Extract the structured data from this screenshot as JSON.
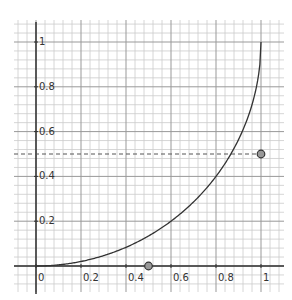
{
  "chart_data": {
    "type": "line",
    "title": "",
    "xlabel": "",
    "ylabel": "",
    "xlim": [
      -0.1,
      1.1
    ],
    "ylim": [
      -0.11,
      1.1
    ],
    "grid": true,
    "grid_major_step": 0.2,
    "grid_minor_step": 0.04,
    "x_ticks": [
      "0",
      "0.2",
      "0.4",
      "0.6",
      "0.8",
      "1"
    ],
    "y_ticks": [
      "0.2",
      "0.4",
      "0.6",
      "0.8",
      "1"
    ],
    "x_tick_values": [
      0,
      0.2,
      0.4,
      0.6,
      0.8,
      1
    ],
    "y_tick_values": [
      0.2,
      0.4,
      0.6,
      0.8,
      1
    ],
    "series": [
      {
        "name": "curve",
        "function": "y = 1 - sqrt(1 - x^2)",
        "x": [
          0,
          0.1,
          0.2,
          0.3,
          0.4,
          0.5,
          0.6,
          0.7,
          0.8,
          0.9,
          0.95,
          1
        ],
        "y": [
          0,
          0.005,
          0.02,
          0.046,
          0.083,
          0.134,
          0.2,
          0.286,
          0.4,
          0.564,
          0.688,
          1
        ],
        "color": "#333333"
      }
    ],
    "points": [
      {
        "x": 1,
        "y": 0.5,
        "label": ""
      },
      {
        "x": 0.5,
        "y": 0,
        "label": ""
      }
    ],
    "reference_lines": [
      {
        "orientation": "horizontal",
        "y": 0.5,
        "style": "dashed"
      }
    ],
    "colors": {
      "axis": "#333333",
      "major_grid": "#999999",
      "minor_grid": "#cccccc",
      "curve": "#333333",
      "point_fill": "#999999",
      "point_stroke": "#333333"
    }
  }
}
